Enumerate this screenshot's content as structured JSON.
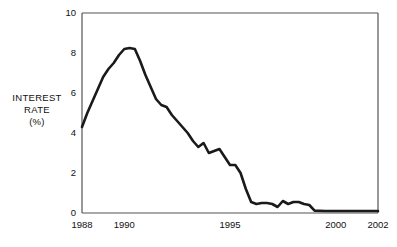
{
  "chart_data": {
    "type": "line",
    "title": "",
    "subtitle": "",
    "xlabel": "",
    "ylabel": "INTEREST RATE (%)",
    "ylabel_lines": [
      "INTEREST",
      "RATE",
      "(%)"
    ],
    "xlim": [
      1988,
      2002
    ],
    "ylim": [
      0,
      10
    ],
    "grid": false,
    "legend": null,
    "line_color": "#1a1a1a",
    "axis_color": "#555555",
    "background": "#ffffff",
    "y_ticks": [
      0,
      2,
      4,
      6,
      8,
      10
    ],
    "y_tick_labels": [
      "0",
      "2",
      "4",
      "6",
      "8",
      "10"
    ],
    "x_ticks": [
      1988,
      1990,
      1995,
      2000,
      2002
    ],
    "x_tick_labels": [
      "1988",
      "1990",
      "1995",
      "2000",
      "2002"
    ],
    "series": [
      {
        "name": "Interest rate",
        "x": [
          1988.0,
          1988.25,
          1988.5,
          1988.75,
          1989.0,
          1989.25,
          1989.5,
          1989.75,
          1990.0,
          1990.25,
          1990.5,
          1990.75,
          1991.0,
          1991.25,
          1991.5,
          1991.75,
          1992.0,
          1992.25,
          1992.5,
          1992.75,
          1993.0,
          1993.25,
          1993.5,
          1993.75,
          1994.0,
          1994.25,
          1994.5,
          1994.75,
          1995.0,
          1995.25,
          1995.5,
          1995.75,
          1996.0,
          1996.25,
          1996.5,
          1996.75,
          1997.0,
          1997.25,
          1997.5,
          1997.75,
          1998.0,
          1998.25,
          1998.5,
          1998.75,
          1999.0,
          1999.5,
          2000.0,
          2000.5,
          2001.0,
          2001.5,
          2002.0
        ],
        "values": [
          4.3,
          5.0,
          5.6,
          6.2,
          6.8,
          7.2,
          7.5,
          7.9,
          8.2,
          8.25,
          8.2,
          7.6,
          6.9,
          6.3,
          5.7,
          5.4,
          5.3,
          4.9,
          4.6,
          4.3,
          4.0,
          3.6,
          3.3,
          3.5,
          3.0,
          3.1,
          3.2,
          2.8,
          2.4,
          2.4,
          2.0,
          1.2,
          0.55,
          0.45,
          0.5,
          0.5,
          0.45,
          0.3,
          0.6,
          0.45,
          0.55,
          0.55,
          0.45,
          0.4,
          0.12,
          0.1,
          0.1,
          0.1,
          0.1,
          0.1,
          0.1
        ]
      }
    ]
  },
  "plot_geometry": {
    "left": 82,
    "right": 378,
    "top": 13,
    "bottom": 213
  }
}
